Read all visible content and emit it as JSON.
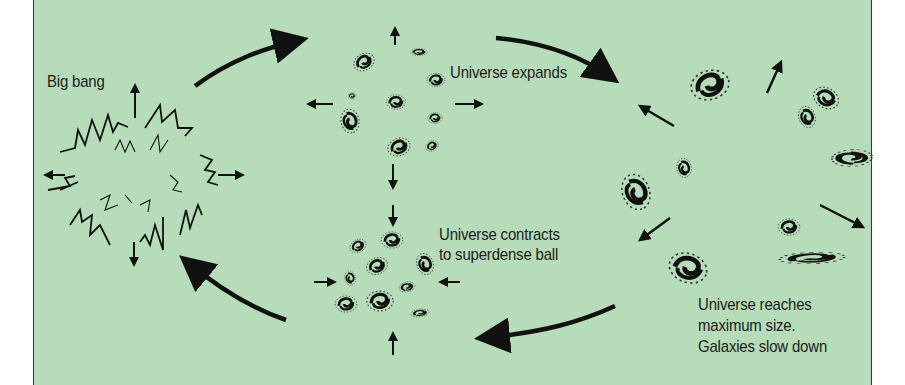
{
  "diagram": {
    "background_color": "#b6dcb9",
    "stages": [
      {
        "id": "big-bang",
        "label": "Big bang"
      },
      {
        "id": "expand",
        "label": "Universe expands"
      },
      {
        "id": "max",
        "label_lines": [
          "Universe reaches",
          "maximum size.",
          "Galaxies slow down"
        ]
      },
      {
        "id": "contract",
        "label_lines": [
          "Universe contracts",
          "to superdense ball"
        ]
      }
    ],
    "cycle_arrows": [
      {
        "from": "big-bang",
        "to": "expand"
      },
      {
        "from": "expand",
        "to": "max"
      },
      {
        "from": "max",
        "to": "contract"
      },
      {
        "from": "contract",
        "to": "big-bang"
      }
    ]
  }
}
